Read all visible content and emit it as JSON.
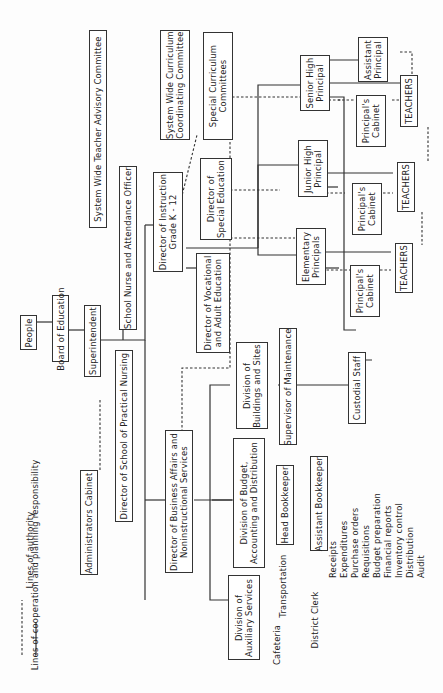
{
  "legend": {
    "dashed_label": "Lines of cooperation and planning responsibility",
    "solid_label": "Lines of authority"
  },
  "nodes": {
    "people": "People",
    "board": "Board of Education",
    "superintendent": "Superintendent",
    "advisory": "System Wide Teacher Advisory Committee",
    "admin_cabinet": "Administrators Cabinet",
    "nurse_officer": "School Nurse and Attendance Officer",
    "practical_nursing": "Director of School of Practical Nursing",
    "instruction": "Director of Instruction\nGrade K - 12",
    "curriculum_coord": "System Wide Curriculum\nCoordinating Committee",
    "special_curriculum": "Special Curriculum\nCommittees",
    "special_ed": "Director of\nSpecial Education",
    "vocational": "Director of Vocational\nand Adult Education",
    "business": "Director of Business Affairs and\nNoninstructional Services",
    "buildings": "Division of\nBuildings and Sites",
    "budget": "Division of Budget,\nAccounting and Distribution",
    "auxiliary": "Division of\nAuxiliary Services",
    "maintenance": "Supervisor of Maintenance",
    "custodial": "Custodial Staff",
    "head_bookkeeper": "Head Bookkeeper",
    "asst_bookkeeper": "Assistant Bookkeeper",
    "senior_high": "Senior High\nPrincipal",
    "junior_high": "Junior High\nPrincipal",
    "elementary": "Elementary\nPrincipals",
    "asst_principal": "Assistant\nPrincipal",
    "cabinet_sh": "Principal's\nCabinet",
    "cabinet_jh": "Principal's\nCabinet",
    "cabinet_el": "Principal's\nCabinet",
    "teachers_sh": "TEACHERS",
    "teachers_jh": "TEACHERS",
    "teachers_el": "TEACHERS"
  },
  "auxiliary_units": {
    "cafeteria": "Cafeteria",
    "transportation": "Transportation",
    "district_clerk": "District Clerk"
  },
  "bookkeeper_duties": "Receipts\nExpenditures\nPurchase orders\nRequisitions\nBudget preparation\nFinancial reports\nInventory control\nDistribution\nAudit"
}
